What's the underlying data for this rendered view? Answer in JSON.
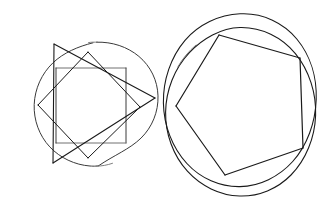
{
  "document": {
    "title": "Hand-drawn geometric figures",
    "figure_count": 2,
    "background_color": "#ffffff",
    "ink_color": "#1a1a1a",
    "width": 332,
    "height": 205
  },
  "figures": [
    {
      "id": "left-figure",
      "name": "circle-with-square-diamond-triangle",
      "description": "Hand-drawn circle containing an axis-aligned square, a rotated square (diamond) and a triangle",
      "shapes": [
        {
          "id": "left-circle",
          "name": "outer-circle",
          "type": "circle",
          "stroke": "#3a3a3a",
          "stroke_width": 1,
          "cx": 96,
          "cy": 104,
          "rx": 62,
          "ry": 62
        },
        {
          "id": "left-square",
          "name": "axis-aligned-square",
          "type": "polygon",
          "stroke": "#5a5a5a",
          "stroke_width": 1,
          "points": [
            [
              56,
              68
            ],
            [
              126,
              68
            ],
            [
              126,
              143
            ],
            [
              56,
              143
            ]
          ]
        },
        {
          "id": "left-diamond",
          "name": "rotated-square",
          "type": "polygon",
          "stroke": "#1a1a1a",
          "stroke_width": 1,
          "points": [
            [
              88,
              52
            ],
            [
              140,
              107
            ],
            [
              88,
              158
            ],
            [
              38,
              105
            ]
          ]
        },
        {
          "id": "left-triangle",
          "name": "inscribed-triangle",
          "type": "polygon",
          "stroke": "#1a1a1a",
          "stroke_width": 1.1,
          "points": [
            [
              54,
              44
            ],
            [
              155,
              98
            ],
            [
              53,
              163
            ]
          ]
        }
      ]
    },
    {
      "id": "right-figure",
      "name": "double-circle-with-pentagon",
      "description": "Two overlapping hand-drawn circles containing an inscribed pentagon",
      "shapes": [
        {
          "id": "right-circle-outer",
          "name": "outer-circle",
          "type": "ellipse",
          "stroke": "#1a1a1a",
          "stroke_width": 1.1,
          "cx": 247,
          "cy": 103,
          "rx": 73,
          "ry": 90
        },
        {
          "id": "right-circle-inner",
          "name": "inner-circle",
          "type": "ellipse",
          "stroke": "#1a1a1a",
          "stroke_width": 1.1,
          "cx": 249,
          "cy": 110,
          "rx": 73,
          "ry": 83
        },
        {
          "id": "right-pentagon",
          "name": "inscribed-pentagon",
          "type": "polygon",
          "stroke": "#1a1a1a",
          "stroke_width": 1.2,
          "points": [
            [
              219,
              35
            ],
            [
              300,
              58
            ],
            [
              303,
              148
            ],
            [
              225,
              175
            ],
            [
              176,
              106
            ]
          ]
        }
      ]
    }
  ]
}
